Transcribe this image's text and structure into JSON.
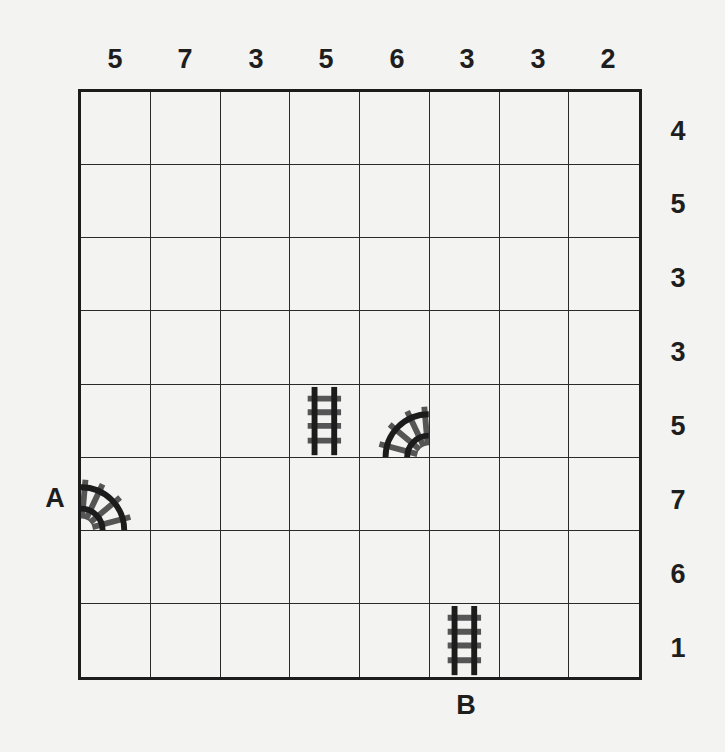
{
  "puzzle": {
    "type": "train-tracks",
    "column_clues": [
      "5",
      "7",
      "3",
      "5",
      "6",
      "3",
      "3",
      "2"
    ],
    "row_clues": [
      "4",
      "5",
      "3",
      "3",
      "5",
      "7",
      "6",
      "1"
    ],
    "start_label": "A",
    "end_label": "B",
    "given_pieces": [
      {
        "row": 5,
        "col": 4,
        "shape": "straight-vertical"
      },
      {
        "row": 5,
        "col": 5,
        "shape": "curve-bottom-right"
      },
      {
        "row": 6,
        "col": 1,
        "shape": "curve-left-bottom"
      },
      {
        "row": 8,
        "col": 6,
        "shape": "straight-vertical"
      }
    ],
    "colors": {
      "rail": "#1c1c1c",
      "tie": "#555555",
      "grid": "#2a2a2a",
      "background": "#f3f3f1"
    }
  }
}
